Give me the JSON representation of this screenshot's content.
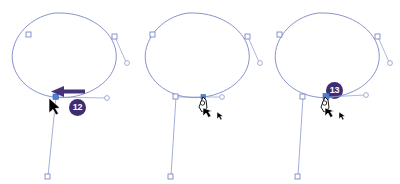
{
  "figure": {
    "background_color": "#ffffff",
    "panel_count": 3
  },
  "colors": {
    "path_stroke": "#7b87c4",
    "path_stroke_light": "#9aa6d4",
    "anchor_stroke": "#6f7cbb",
    "anchor_fill_hollow": "#ffffff",
    "anchor_fill_selected": "#4f7fd0",
    "handle_line": "#8d99cf",
    "badge_background": "#3f2c73",
    "badge_text": "#ffffff",
    "callout_arrow": "#463278",
    "cursor_black": "#000000",
    "cursor_white": "#ffffff"
  },
  "panels": [
    {
      "id": "panel-1",
      "name": "panel-step-12",
      "badge": {
        "label": "12",
        "visible": true
      },
      "callout_arrow": {
        "visible": true,
        "direction": "left",
        "color": "#463278"
      },
      "cursor": {
        "type": "arrow-cursor",
        "visible": true
      },
      "selected_anchor": {
        "state": "selected",
        "fill": "#4f7fd0"
      },
      "shape": "ellipse-with-open-path",
      "anchors": [
        {
          "name": "anchor-top-left",
          "kind": "hollow-square"
        },
        {
          "name": "anchor-top-right",
          "kind": "hollow-square"
        },
        {
          "name": "anchor-bottom-left",
          "kind": "filled-square"
        },
        {
          "name": "endpoint-bottom",
          "kind": "hollow-square"
        }
      ],
      "handles": [
        {
          "name": "handle-right",
          "kind": "hollow-circle"
        },
        {
          "name": "handle-bottom-right",
          "kind": "hollow-circle"
        }
      ]
    },
    {
      "id": "panel-2",
      "name": "panel-step-13",
      "badge": {
        "label": "13",
        "visible": true
      },
      "callout_arrow": {
        "visible": false,
        "direction": "",
        "color": ""
      },
      "cursor": {
        "type": "pen-tool-cursor",
        "visible": true
      },
      "selected_anchor": {
        "state": "hover",
        "fill": "#4f7fd0"
      },
      "shape": "ellipse-with-open-path",
      "anchors": [
        {
          "name": "anchor-top-left",
          "kind": "hollow-square"
        },
        {
          "name": "anchor-top-right",
          "kind": "hollow-square"
        },
        {
          "name": "anchor-bottom-left",
          "kind": "hollow-square"
        },
        {
          "name": "endpoint-bottom",
          "kind": "hollow-square"
        }
      ],
      "handles": [
        {
          "name": "handle-right",
          "kind": "hollow-circle"
        },
        {
          "name": "handle-bottom-right",
          "kind": "hollow-circle"
        }
      ]
    },
    {
      "id": "panel-3",
      "name": "panel-step-final",
      "badge": {
        "label": "",
        "visible": false
      },
      "callout_arrow": {
        "visible": false,
        "direction": "",
        "color": ""
      },
      "cursor": {
        "type": "pen-tool-cursor",
        "visible": true
      },
      "selected_anchor": {
        "state": "selected",
        "fill": "#4f7fd0"
      },
      "shape": "ellipse-with-open-path",
      "anchors": [
        {
          "name": "anchor-top-left",
          "kind": "hollow-square"
        },
        {
          "name": "anchor-top-right",
          "kind": "hollow-square"
        },
        {
          "name": "anchor-bottom-left",
          "kind": "hollow-square"
        },
        {
          "name": "endpoint-bottom",
          "kind": "hollow-square"
        }
      ],
      "handles": [
        {
          "name": "handle-right",
          "kind": "hollow-circle"
        },
        {
          "name": "handle-bottom-right",
          "kind": "hollow-circle"
        }
      ]
    }
  ]
}
